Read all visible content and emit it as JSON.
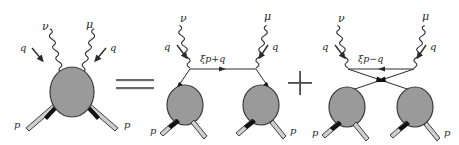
{
  "figure": {
    "type": "feynman-diagram-equation",
    "background_color": "#ffffff",
    "ink_color": "#2b2b2b",
    "blob_fill": "#9a9a9a",
    "blob_stroke": "#3a3a3a",
    "operators": {
      "equals": "=",
      "plus": "+"
    },
    "diagrams": [
      {
        "id": "lhs-handbag",
        "role": "left-hand-side",
        "blob_count": 1,
        "photon_labels": [
          "ν",
          "μ"
        ],
        "momentum_labels": [
          "q",
          "q"
        ],
        "proton_labels": [
          "p",
          "p"
        ],
        "internal_line_label": ""
      },
      {
        "id": "rhs-direct",
        "role": "right-hand-side-direct",
        "blob_count": 2,
        "photon_labels": [
          "ν",
          "μ"
        ],
        "momentum_labels": [
          "q",
          "q"
        ],
        "proton_labels": [
          "p",
          "p"
        ],
        "internal_line_label": "ξp+q"
      },
      {
        "id": "rhs-crossed",
        "role": "right-hand-side-crossed",
        "blob_count": 2,
        "photon_labels": [
          "ν",
          "μ"
        ],
        "momentum_labels": [
          "q",
          "q"
        ],
        "proton_labels": [
          "p",
          "p"
        ],
        "internal_line_label": "ξp−q"
      }
    ]
  }
}
